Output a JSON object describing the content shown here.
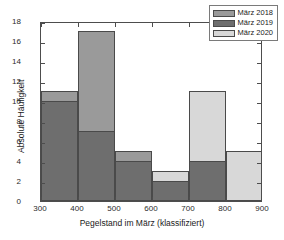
{
  "chart_data": {
    "type": "bar",
    "title": "",
    "subtitle": "",
    "xlabel": "Pegelstand im März (klassifiziert)",
    "ylabel": "Absolute Häufigkeit",
    "bin_edges": [
      300,
      400,
      500,
      600,
      700,
      800,
      900
    ],
    "categories": [
      "300-400",
      "400-500",
      "500-600",
      "600-700",
      "700-800",
      "800-900"
    ],
    "xlim": [
      300,
      900
    ],
    "ylim": [
      0,
      18
    ],
    "xticks": [
      "300",
      "400",
      "500",
      "600",
      "700",
      "800",
      "900"
    ],
    "yticks": [
      "0",
      "2",
      "4",
      "6",
      "8",
      "10",
      "12",
      "14",
      "16",
      "18"
    ],
    "grid": false,
    "bar_mode": "overlay",
    "legend_position": "top-right",
    "series": [
      {
        "name": "März 2018",
        "color": "#9a9a9a",
        "values": [
          11,
          17,
          5,
          2,
          4,
          0
        ]
      },
      {
        "name": "März 2019",
        "color": "#6e6e6e",
        "values": [
          10,
          7,
          4,
          2,
          4,
          0
        ]
      },
      {
        "name": "März 2020",
        "color": "#d8d8d8",
        "values": [
          1,
          7,
          3,
          3,
          11,
          5
        ]
      }
    ]
  },
  "legend": {
    "items": [
      {
        "label": "März 2018"
      },
      {
        "label": "März 2019"
      },
      {
        "label": "März 2020"
      }
    ]
  },
  "axes": {
    "x_title": "Pegelstand im März (klassifiziert)",
    "y_title": "Absolute Häufigkeit"
  }
}
